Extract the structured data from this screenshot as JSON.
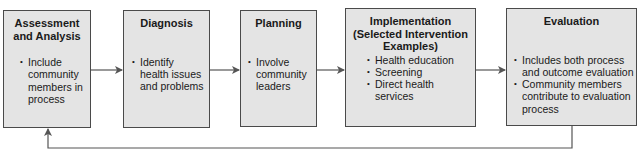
{
  "diagram": {
    "type": "process-flow",
    "steps": [
      {
        "title": "Assessment and Analysis",
        "title_lines": [
          "Assessment",
          "and Analysis"
        ],
        "bullets": [
          "Include community members in process"
        ],
        "bullet_lines": [
          [
            "Include",
            "community",
            "members in",
            "process"
          ]
        ]
      },
      {
        "title": "Diagnosis",
        "title_lines": [
          "Diagnosis"
        ],
        "bullets": [
          "Identify health issues and problems"
        ],
        "bullet_lines": [
          [
            "Identify",
            "health issues",
            "and problems"
          ]
        ]
      },
      {
        "title": "Planning",
        "title_lines": [
          "Planning"
        ],
        "bullets": [
          "Involve community leaders"
        ],
        "bullet_lines": [
          [
            "Involve",
            "community",
            "leaders"
          ]
        ]
      },
      {
        "title": "Implementation (Selected Intervention Examples)",
        "title_lines": [
          "Implementation",
          "(Selected Intervention",
          "Examples)"
        ],
        "bullets": [
          "Health education",
          "Screening",
          "Direct health services"
        ],
        "bullet_lines": [
          [
            "Health education"
          ],
          [
            "Screening"
          ],
          [
            "Direct health",
            "services"
          ]
        ]
      },
      {
        "title": "Evaluation",
        "title_lines": [
          "Evaluation"
        ],
        "bullets": [
          "Includes both process and outcome evaluation",
          "Community members contribute to evaluation process"
        ],
        "bullet_lines": [
          [
            "Includes both process",
            "and outcome evaluation"
          ],
          [
            "Community members",
            "contribute to evaluation",
            "process"
          ]
        ]
      }
    ],
    "connections": [
      {
        "from": 0,
        "to": 1
      },
      {
        "from": 1,
        "to": 2
      },
      {
        "from": 2,
        "to": 3
      },
      {
        "from": 3,
        "to": 4
      },
      {
        "from": 4,
        "to": 0,
        "kind": "feedback-loop"
      }
    ],
    "colors": {
      "box_fill": "#e4e4e4",
      "box_border": "#4a4a4a",
      "arrow": "#555555"
    }
  }
}
